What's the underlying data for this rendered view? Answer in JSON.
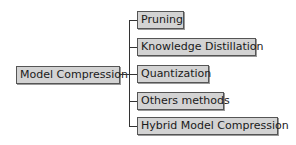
{
  "diagram": {
    "root": {
      "label": "Model Compression"
    },
    "children": [
      {
        "label": "Pruning"
      },
      {
        "label": "Knowledge Distillation"
      },
      {
        "label": "Quantization"
      },
      {
        "label": "Others methods"
      },
      {
        "label": "Hybrid Model Compression"
      }
    ],
    "colors": {
      "node_fill": "#d3d3d3",
      "node_border": "#555555",
      "line": "#333333"
    }
  }
}
